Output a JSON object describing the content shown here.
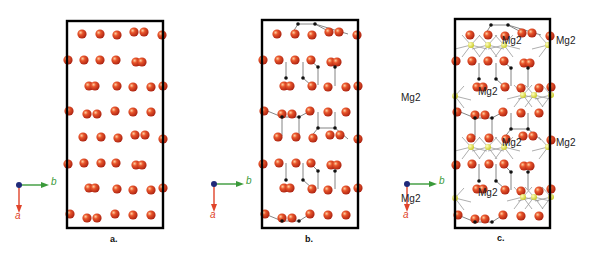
{
  "figure": {
    "panels": [
      {
        "id": "a",
        "label": "a.",
        "box": {
          "x": 67,
          "y": 21,
          "w": 96,
          "h": 207
        }
      },
      {
        "id": "b",
        "label": "b.",
        "box": {
          "x": 262,
          "y": 20,
          "w": 96,
          "h": 208
        }
      },
      {
        "id": "c",
        "label": "c.",
        "box": {
          "x": 455,
          "y": 19,
          "w": 95,
          "h": 209
        }
      }
    ],
    "axes": {
      "b_label": "b",
      "a_label": "a",
      "b_color": "#3a9a3a",
      "a_color": "#e0442a",
      "origin_color": "#1f2a7a"
    },
    "mg_label": "Mg2",
    "colors": {
      "oxygen": "#d83a1c",
      "oxygen_highlight": "#f7b07a",
      "carbon": "#111111",
      "magnesium": "#e8e84a",
      "bond": "#888888",
      "box": "#000000"
    }
  }
}
